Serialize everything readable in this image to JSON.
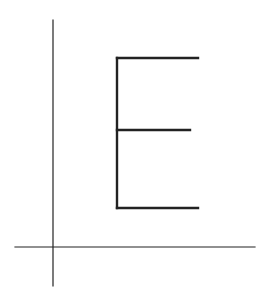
{
  "diagram": {
    "colors": {
      "background": "#ffffff",
      "axis": "#222222",
      "letter": "#222222"
    },
    "axes": {
      "x_axis": {
        "x1": 15,
        "y1": 247,
        "x2": 255,
        "y2": 247,
        "stroke_width": 1.2
      },
      "y_axis": {
        "x1": 53,
        "y1": 20,
        "x2": 53,
        "y2": 286,
        "stroke_width": 1.2
      }
    },
    "letter_e": {
      "stroke_width": 2.4,
      "spine": {
        "x1": 117,
        "y1": 58,
        "x2": 117,
        "y2": 208
      },
      "top_arm": {
        "x1": 117,
        "y1": 58,
        "x2": 198,
        "y2": 58
      },
      "middle_arm": {
        "x1": 117,
        "y1": 130,
        "x2": 190,
        "y2": 130
      },
      "bottom_arm": {
        "x1": 117,
        "y1": 208,
        "x2": 198,
        "y2": 208
      }
    }
  }
}
